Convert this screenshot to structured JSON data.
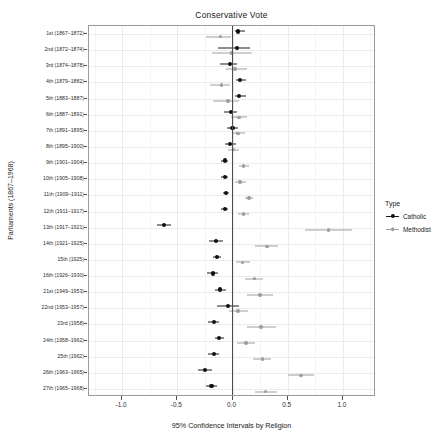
{
  "chart_data": {
    "type": "scatter",
    "plot_kind": "forest-plot",
    "title": "Conservative Vote",
    "xlabel": "95% Confidence Intervals by Religion",
    "ylabel": "Parliaments (1867–1968)",
    "xlim": [
      -1.3,
      1.3
    ],
    "xticks": [
      -1.0,
      -0.5,
      0.0,
      0.5,
      1.0
    ],
    "xticklabels": [
      "-1.0",
      "-0.5",
      "0.0",
      "0.5",
      "1.0"
    ],
    "grid": true,
    "reference_line": 0.0,
    "legend": {
      "title": "Type",
      "position": "right",
      "entries": [
        {
          "name": "Catholic",
          "color": "#1a1a1a"
        },
        {
          "name": "Methodist",
          "color": "#9d9d9d"
        }
      ]
    },
    "categories": [
      "1st (1867–1872)",
      "2nd (1872–1874)",
      "3rd (1874–1878)",
      "4th (1879–1882)",
      "5th (1883–1887)",
      "6th (1887–1891)",
      "7th (1891–1895)",
      "8th (1895–1900)",
      "9th (1901–1904)",
      "10th (1905–1908)",
      "11th (1909–1911)",
      "12th (1911–1917)",
      "13th (1917–1921)",
      "14th (1921–1925)",
      "15th (1925)",
      "16th (1926–1930)",
      "21st (1949–1953)",
      "22nd (1953–1957)",
      "23rd (1958)",
      "24th (1958–1962)",
      "25th (1962)",
      "26th (1963–1965)",
      "27th (1965–1968)"
    ],
    "series": [
      {
        "name": "Catholic",
        "color": "#1a1a1a",
        "estimates": [
          0.05,
          0.04,
          -0.02,
          0.07,
          0.06,
          -0.01,
          0.0,
          -0.02,
          -0.07,
          -0.07,
          -0.06,
          -0.07,
          -0.62,
          -0.15,
          -0.14,
          -0.18,
          -0.11,
          -0.04,
          -0.17,
          -0.12,
          -0.17,
          -0.25,
          -0.19
        ],
        "ci_low": [
          0.02,
          -0.13,
          -0.11,
          0.03,
          0.02,
          -0.08,
          -0.05,
          -0.07,
          -0.1,
          -0.1,
          -0.09,
          -0.1,
          -0.68,
          -0.21,
          -0.18,
          -0.23,
          -0.16,
          -0.14,
          -0.22,
          -0.16,
          -0.22,
          -0.31,
          -0.24
        ],
        "ci_high": [
          0.11,
          0.16,
          0.04,
          0.12,
          0.12,
          0.04,
          0.05,
          0.03,
          -0.04,
          -0.04,
          -0.03,
          -0.04,
          -0.56,
          -0.09,
          -0.1,
          -0.13,
          -0.06,
          0.06,
          -0.12,
          -0.08,
          -0.12,
          -0.19,
          -0.14
        ]
      },
      {
        "name": "Methodist",
        "color": "#9d9d9d",
        "estimates": [
          -0.11,
          -0.01,
          0.02,
          -0.1,
          -0.04,
          0.06,
          0.05,
          0.01,
          0.1,
          0.07,
          0.15,
          0.1,
          0.87,
          0.31,
          0.09,
          0.2,
          0.25,
          0.05,
          0.26,
          0.12,
          0.27,
          0.62,
          0.3
        ],
        "ci_low": [
          -0.24,
          -0.19,
          -0.06,
          -0.2,
          -0.18,
          -0.01,
          0.0,
          -0.04,
          0.06,
          0.02,
          0.11,
          0.05,
          0.66,
          0.2,
          0.03,
          0.11,
          0.13,
          -0.03,
          0.13,
          0.04,
          0.19,
          0.5,
          0.2
        ],
        "ci_high": [
          -0.01,
          0.18,
          0.13,
          -0.02,
          0.06,
          0.13,
          0.11,
          0.06,
          0.15,
          0.12,
          0.19,
          0.15,
          1.08,
          0.41,
          0.16,
          0.28,
          0.37,
          0.14,
          0.39,
          0.2,
          0.35,
          0.74,
          0.4
        ]
      }
    ]
  }
}
